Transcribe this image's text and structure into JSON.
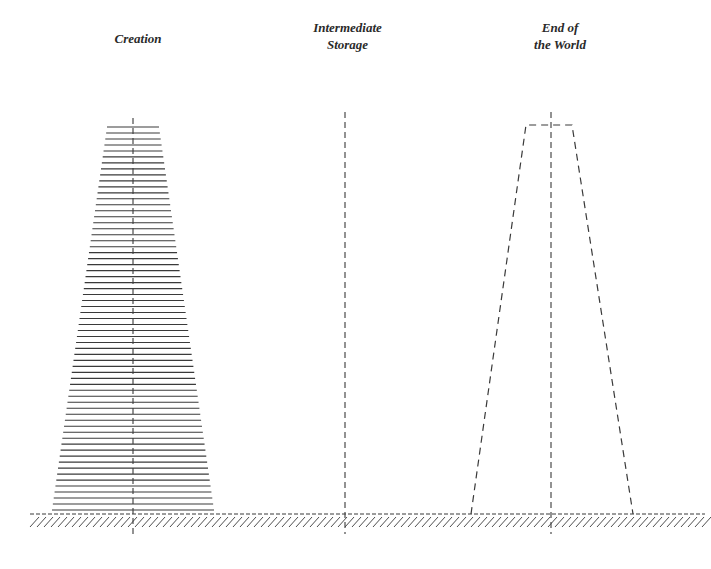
{
  "labels": {
    "creation": "Creation",
    "intermediate_line1": "Intermediate",
    "intermediate_line2": "Storage",
    "end_line1": "End of",
    "end_line2": "the World"
  },
  "diagram": {
    "ground_y": 514,
    "ground_x": [
      30,
      705
    ],
    "stroke_color": "#3a3a3a",
    "left_stack": {
      "center_x": 133,
      "top_y": 127,
      "bottom_y": 510,
      "top_half_width": 26,
      "bottom_half_width": 81,
      "line_count": 65
    },
    "middle_axis_x": 345,
    "right_outline": {
      "center_x": 551,
      "top_y": 125,
      "top_left_x": 526,
      "top_right_x": 572,
      "bottom_left_x": 471,
      "bottom_right_x": 633
    }
  }
}
